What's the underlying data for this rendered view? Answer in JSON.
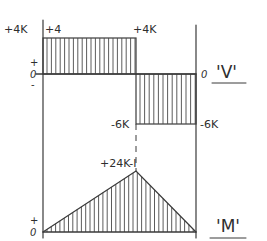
{
  "diagram": {
    "type": "shear-and-moment-diagram",
    "shear": {
      "title": "'V'",
      "zero_label_left": "0",
      "zero_label_right": "0",
      "plus_sign": "+",
      "minus_sign": "-",
      "left_value_label": "+4K",
      "left_inner_label": "+4",
      "mid_top_label": "+4K",
      "mid_bottom_label": "-6K",
      "right_value_label": "-6K",
      "segments": [
        {
          "from": 0,
          "to": 0.61,
          "value": 4,
          "unit": "K"
        },
        {
          "from": 0.61,
          "to": 1.0,
          "value": -6,
          "unit": "K"
        }
      ]
    },
    "moment": {
      "title": "'M'",
      "zero_label": "0",
      "plus_sign": "+",
      "peak_label": "+24K-I",
      "points": [
        {
          "x": 0,
          "value": 0
        },
        {
          "x": 0.61,
          "value": 24
        },
        {
          "x": 1.0,
          "value": 0
        }
      ],
      "unit": "K-ft"
    }
  }
}
